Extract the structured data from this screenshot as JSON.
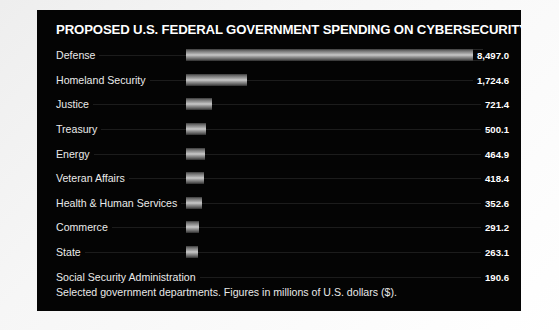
{
  "panel": {
    "title": "PROPOSED U.S. FEDERAL GOVERNMENT SPENDING ON CYBERSECURITY, 2019",
    "footnote": "Selected government departments. Figures in millions of U.S. dollars ($).",
    "background_color": "#040404",
    "text_color": "#ffffff",
    "page_background_color": "#f2f2f2",
    "bar_color": "#c9c9c9"
  },
  "chart_data": {
    "type": "bar",
    "orientation": "horizontal",
    "title": "PROPOSED U.S. FEDERAL GOVERNMENT SPENDING ON CYBERSECURITY, 2019",
    "subtitle": "",
    "xlabel": "",
    "ylabel": "",
    "annotations": [
      "Selected government departments. Figures in millions of U.S. dollars ($)."
    ],
    "units": "millions of U.S. dollars ($)",
    "grid": false,
    "legend": "none",
    "xlim": [
      0,
      8497.0
    ],
    "categories": [
      "Defense",
      "Homeland Security",
      "Justice",
      "Treasury",
      "Energy",
      "Veteran Affairs",
      "Health & Human Services",
      "Commerce",
      "State",
      "Social Security Administration"
    ],
    "values": [
      8497.0,
      1724.6,
      721.4,
      500.1,
      464.9,
      418.4,
      352.6,
      291.2,
      263.1,
      190.6
    ],
    "value_labels": [
      "8,497.0",
      "1,724.6",
      "721.4",
      "500.1",
      "464.9",
      "418.4",
      "352.6",
      "291.2",
      "263.1",
      "190.6"
    ],
    "bar_pixel_widths": [
      297,
      61,
      26,
      20,
      19,
      18,
      16,
      13,
      12,
      9
    ]
  }
}
